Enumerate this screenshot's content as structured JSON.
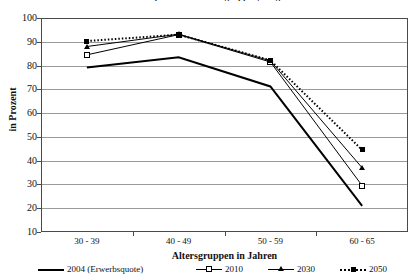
{
  "chart": {
    "title": "Erwerbsquoten nach Altersgruppen, Prognose",
    "xlabel": "Altersgruppen in Jahren",
    "ylabel": "in Prozent"
  },
  "axis": {
    "y_ticks": [
      "100",
      "90",
      "80",
      "70",
      "60",
      "50",
      "40",
      "30",
      "20",
      "10"
    ],
    "x_ticks": [
      "30 - 39",
      "40 - 49",
      "50 - 59",
      "60 - 65"
    ]
  },
  "legend": {
    "items": [
      {
        "label": "2004 (Erwerbsquote)",
        "marker": "none",
        "line": "solid-thick"
      },
      {
        "label": "2010",
        "marker": "open-square",
        "line": "solid-thin"
      },
      {
        "label": "2030",
        "marker": "filled-triangle",
        "line": "solid-thin"
      },
      {
        "label": "2050",
        "marker": "filled-square",
        "line": "dotted"
      }
    ]
  },
  "chart_data": {
    "type": "line",
    "title": "Erwerbsquoten nach Altersgruppen, Prognose",
    "xlabel": "Altersgruppen in Jahren",
    "ylabel": "in Prozent",
    "ylim": [
      10,
      100
    ],
    "ytick_step": 10,
    "grid": true,
    "legend_position": "bottom",
    "categories": [
      "30 - 39",
      "40 - 49",
      "50 - 59",
      "60 - 65"
    ],
    "series": [
      {
        "name": "2004 (Erwerbsquote)",
        "color": "#000000",
        "marker": "none",
        "linestyle": "solid",
        "linewidth": 2,
        "values": [
          79.2,
          83.5,
          71.2,
          21.0
        ]
      },
      {
        "name": "2010",
        "color": "#000000",
        "marker": "open-square",
        "linestyle": "solid",
        "linewidth": 1,
        "values": [
          84.5,
          93.0,
          81.5,
          29.5
        ]
      },
      {
        "name": "2030",
        "color": "#000000",
        "marker": "filled-triangle",
        "linestyle": "solid",
        "linewidth": 1,
        "values": [
          88.0,
          93.2,
          82.0,
          37.0
        ]
      },
      {
        "name": "2050",
        "color": "#000000",
        "marker": "filled-square",
        "linestyle": "dotted",
        "linewidth": 2,
        "values": [
          90.3,
          93.0,
          82.2,
          44.5
        ]
      }
    ]
  }
}
